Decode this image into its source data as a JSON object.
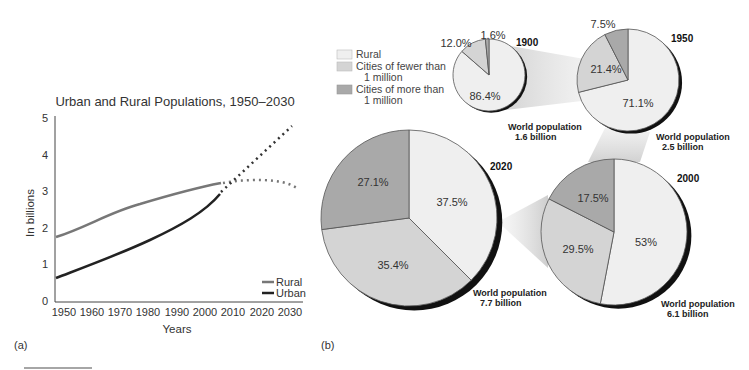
{
  "panel_a_label": "(a)",
  "panel_b_label": "(b)",
  "chart_data": [
    {
      "type": "line",
      "title": "Urban and Rural Populations, 1950–2030",
      "xlabel": "Years",
      "ylabel": "In billions",
      "xticks": [
        "1950",
        "1960",
        "1970",
        "1980",
        "1990",
        "2000",
        "2010",
        "2020",
        "2030"
      ],
      "yticks": [
        "0",
        "1",
        "2",
        "3",
        "4",
        "5"
      ],
      "ylim": [
        0,
        5
      ],
      "xlim": [
        1950,
        2030
      ],
      "grid": false,
      "legend_position": "lower right",
      "series": [
        {
          "name": "Rural",
          "color": "#777777",
          "x": [
            1949,
            1960,
            1970,
            1980,
            1990,
            2000,
            2006
          ],
          "values": [
            1.75,
            2.0,
            2.35,
            2.7,
            3.0,
            3.2,
            3.27
          ],
          "projected_x": [
            2006,
            2010,
            2020,
            2030,
            2032
          ],
          "projected_values": [
            3.27,
            3.32,
            3.33,
            3.25,
            3.15
          ]
        },
        {
          "name": "Urban",
          "color": "#222222",
          "x": [
            1949,
            1960,
            1970,
            1980,
            1990,
            2000,
            2006
          ],
          "values": [
            0.65,
            0.95,
            1.3,
            1.7,
            2.1,
            2.6,
            2.95
          ],
          "projected_x": [
            2006,
            2010,
            2020,
            2030,
            2032
          ],
          "projected_values": [
            2.95,
            3.35,
            4.0,
            4.6,
            4.8
          ]
        }
      ]
    },
    {
      "type": "pie",
      "legend": [
        {
          "label": "Rural",
          "color": "#efefef"
        },
        {
          "label_line1": "Cities of fewer than",
          "label_line2": "1 million",
          "label": "Cities of fewer than 1 million",
          "color": "#d4d4d4"
        },
        {
          "label_line1": "Cities of more than",
          "label_line2": "1 million",
          "label": "Cities of more than 1 million",
          "color": "#a9a9a9"
        }
      ],
      "pies": [
        {
          "year": "1900",
          "world_population_line1": "World population",
          "world_population_line2": "1.6 billion",
          "slices": [
            {
              "name": "Rural",
              "value": 86.4,
              "label": "86.4%"
            },
            {
              "name": "Cities of fewer than 1 million",
              "value": 12.0,
              "label": "12.0%"
            },
            {
              "name": "Cities of more than 1 million",
              "value": 1.6,
              "label": "1.6%"
            }
          ]
        },
        {
          "year": "1950",
          "world_population_line1": "World population",
          "world_population_line2": "2.5 billion",
          "slices": [
            {
              "name": "Rural",
              "value": 71.1,
              "label": "71.1%"
            },
            {
              "name": "Cities of fewer than 1 million",
              "value": 21.4,
              "label": "21.4%"
            },
            {
              "name": "Cities of more than 1 million",
              "value": 7.5,
              "label": "7.5%"
            }
          ]
        },
        {
          "year": "2000",
          "world_population_line1": "World population",
          "world_population_line2": "6.1 billion",
          "slices": [
            {
              "name": "Rural",
              "value": 53,
              "label": "53%"
            },
            {
              "name": "Cities of fewer than 1 million",
              "value": 29.5,
              "label": "29.5%"
            },
            {
              "name": "Cities of more than 1 million",
              "value": 17.5,
              "label": "17.5%"
            }
          ]
        },
        {
          "year": "2020",
          "world_population_line1": "World population",
          "world_population_line2": "7.7 billion",
          "slices": [
            {
              "name": "Rural",
              "value": 37.5,
              "label": "37.5%"
            },
            {
              "name": "Cities of fewer than 1 million",
              "value": 35.4,
              "label": "35.4%"
            },
            {
              "name": "Cities of more than 1 million",
              "value": 27.1,
              "label": "27.1%"
            }
          ]
        }
      ]
    }
  ]
}
